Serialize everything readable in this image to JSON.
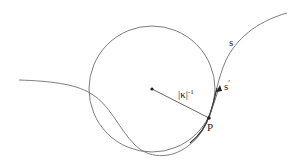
{
  "figure": {
    "width": 303,
    "height": 165,
    "stroke_color": "#6e6e6e",
    "dark_color": "#222222",
    "osculating_circle": {
      "center": [
        152,
        89
      ],
      "radius": 63
    },
    "point_P": [
      209,
      118
    ],
    "labels": {
      "radius": "|κ|",
      "radius_exp": "-1",
      "point": "P",
      "curve": "s",
      "tangent": "s",
      "tangent_prime": "′"
    }
  }
}
